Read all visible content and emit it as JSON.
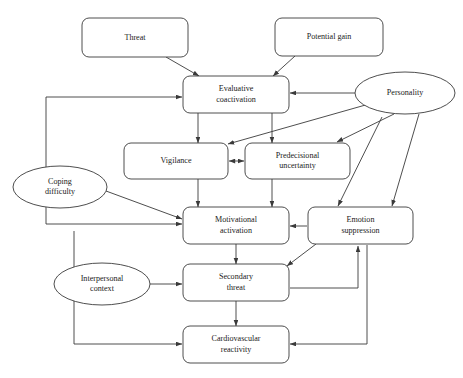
{
  "diagram": {
    "type": "flowchart",
    "background_color": "#ffffff",
    "stroke_color": "#3a3a3a",
    "text_color": "#1a1a1a",
    "nodes": [
      {
        "id": "threat",
        "label": "Threat",
        "lines": [
          "Threat"
        ],
        "shape": "rounded-rect",
        "x": 82,
        "y": 18,
        "w": 106,
        "h": 39
      },
      {
        "id": "potential_gain",
        "label": "Potential gain",
        "lines": [
          "Potential gain"
        ],
        "shape": "rounded-rect",
        "x": 275,
        "y": 18,
        "w": 108,
        "h": 38
      },
      {
        "id": "evaluative_coactivation",
        "label": "Evaluative coactivation",
        "lines": [
          "Evaluative",
          "coactivation"
        ],
        "shape": "rounded-rect",
        "x": 183,
        "y": 76,
        "w": 106,
        "h": 37
      },
      {
        "id": "personality",
        "label": "Personality",
        "lines": [
          "Personality"
        ],
        "shape": "ellipse",
        "cx": 405,
        "cy": 93,
        "rx": 50,
        "ry": 21
      },
      {
        "id": "vigilance",
        "label": "Vigilance",
        "lines": [
          "Vigilance"
        ],
        "shape": "rounded-rect",
        "x": 124,
        "y": 143,
        "w": 104,
        "h": 36
      },
      {
        "id": "predecisional_uncertainty",
        "label": "Predecisional uncertainty",
        "lines": [
          "Predecisional",
          "uncertainty"
        ],
        "shape": "rounded-rect",
        "x": 245,
        "y": 143,
        "w": 105,
        "h": 36
      },
      {
        "id": "coping_difficulty",
        "label": "Coping difficulty",
        "lines": [
          "Coping",
          "difficulty"
        ],
        "shape": "ellipse",
        "cx": 60,
        "cy": 187,
        "rx": 47,
        "ry": 21
      },
      {
        "id": "motivational_activation",
        "label": "Motivational activation",
        "lines": [
          "Motivational",
          "activation"
        ],
        "shape": "rounded-rect",
        "x": 183,
        "y": 207,
        "w": 106,
        "h": 37
      },
      {
        "id": "emotion_suppression",
        "label": "Emotion suppression",
        "lines": [
          "Emotion",
          "suppression"
        ],
        "shape": "rounded-rect",
        "x": 308,
        "y": 207,
        "w": 105,
        "h": 37
      },
      {
        "id": "interpersonal_context",
        "label": "Interpersonal context",
        "lines": [
          "Interpersonal",
          "context"
        ],
        "shape": "ellipse",
        "cx": 102,
        "cy": 284,
        "rx": 48,
        "ry": 21
      },
      {
        "id": "secondary_threat",
        "label": "Secondary threat",
        "lines": [
          "Secondary",
          "threat"
        ],
        "shape": "rounded-rect",
        "x": 183,
        "y": 264,
        "w": 106,
        "h": 37
      },
      {
        "id": "cardiovascular_reactivity",
        "label": "Cardiovascular reactivity",
        "lines": [
          "Cardiovascular",
          "reactivity"
        ],
        "shape": "rounded-rect",
        "x": 183,
        "y": 326,
        "w": 106,
        "h": 37
      }
    ],
    "edges": [
      {
        "id": "threat-to-evaluative",
        "from": "threat",
        "to": "evaluative_coactivation",
        "arrow": "end",
        "path": "M 166 57 L 199 76"
      },
      {
        "id": "potential-gain-to-evaluative",
        "from": "potential_gain",
        "to": "evaluative_coactivation",
        "arrow": "end",
        "path": "M 295 56 L 273 76"
      },
      {
        "id": "personality-to-evaluative",
        "from": "personality",
        "to": "evaluative_coactivation",
        "arrow": "end",
        "path": "M 355 93 L 290 93"
      },
      {
        "id": "evaluative-to-vigilance",
        "from": "evaluative_coactivation",
        "to": "vigilance",
        "arrow": "end",
        "path": "M 198 113 L 198 143"
      },
      {
        "id": "evaluative-to-predecisional",
        "from": "evaluative_coactivation",
        "to": "predecisional_uncertainty",
        "arrow": "end",
        "path": "M 272 113 L 272 143"
      },
      {
        "id": "personality-to-vigilance",
        "from": "personality",
        "to": "vigilance",
        "arrow": "end",
        "path": "M 369 104 L 228 144"
      },
      {
        "id": "personality-to-predecisional",
        "from": "personality",
        "to": "predecisional_uncertainty",
        "arrow": "end",
        "path": "M 394 114 L 337 142"
      },
      {
        "id": "personality-to-emotion-suppression",
        "from": "personality",
        "to": "emotion_suppression",
        "arrow": "end",
        "path": "M 419 114 L 392 206"
      },
      {
        "id": "vigilance-predecisional-bidirectional",
        "from": "vigilance",
        "to": "predecisional_uncertainty",
        "arrow": "both",
        "path": "M 229 161 L 244 161"
      },
      {
        "id": "vigilance-to-motivational",
        "from": "vigilance",
        "to": "motivational_activation",
        "arrow": "end",
        "path": "M 198 179 L 198 207"
      },
      {
        "id": "predecisional-to-motivational",
        "from": "predecisional_uncertainty",
        "to": "motivational_activation",
        "arrow": "end",
        "path": "M 272 179 L 272 207"
      },
      {
        "id": "predecisional-to-emotion-suppression",
        "from": "predecisional_uncertainty",
        "to": "emotion_suppression",
        "arrow": "end",
        "path": "M 382 117 L 338 206"
      },
      {
        "id": "evaluative-left-feedback-to-motivational",
        "from": "evaluative_coactivation",
        "to": "motivational_activation",
        "arrow": "end",
        "path": "M 46 97 L 46 224 L 182 224"
      },
      {
        "id": "feedback-into-evaluative-left",
        "from": "loop",
        "to": "evaluative_coactivation",
        "arrow": "end",
        "path": "M 46 97 L 182 97"
      },
      {
        "id": "coping-difficulty-to-motivational",
        "from": "coping_difficulty",
        "to": "motivational_activation",
        "arrow": "end",
        "path": "M 106 191 L 182 219"
      },
      {
        "id": "emotion-suppression-to-motivational",
        "from": "emotion_suppression",
        "to": "motivational_activation",
        "arrow": "end",
        "path": "M 307 226 L 290 226"
      },
      {
        "id": "motivational-to-secondary-threat",
        "from": "motivational_activation",
        "to": "secondary_threat",
        "arrow": "end",
        "path": "M 236 244 L 236 264"
      },
      {
        "id": "emotion-suppression-to-secondary-threat",
        "from": "emotion_suppression",
        "to": "secondary_threat",
        "arrow": "end",
        "path": "M 316 244 L 287 266"
      },
      {
        "id": "interpersonal-to-secondary-threat",
        "from": "interpersonal_context",
        "to": "secondary_threat",
        "arrow": "end",
        "path": "M 150 284 L 182 284"
      },
      {
        "id": "motivational-to-cardiovascular",
        "from": "motivational_activation",
        "to": "cardiovascular_reactivity",
        "arrow": "end",
        "path": "M 74 231 L 74 344 L 182 344"
      },
      {
        "id": "secondary-threat-to-emotion-suppression",
        "from": "secondary_threat",
        "to": "emotion_suppression",
        "arrow": "end",
        "path": "M 290 288 L 358 288 L 358 246"
      },
      {
        "id": "secondary-threat-to-cardiovascular",
        "from": "secondary_threat",
        "to": "cardiovascular_reactivity",
        "arrow": "end",
        "path": "M 236 301 L 236 326"
      },
      {
        "id": "emotion-suppression-to-cardiovascular",
        "from": "emotion_suppression",
        "to": "cardiovascular_reactivity",
        "arrow": "end",
        "path": "M 367 245 L 367 344 L 290 344"
      }
    ]
  }
}
